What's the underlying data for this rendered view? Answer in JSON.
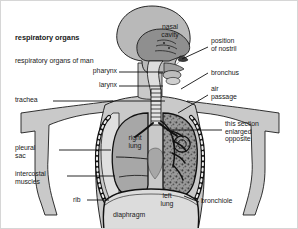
{
  "figure": {
    "title": "respiratory organs",
    "caption": "respiratory organs of man",
    "type": "anatomical-diagram"
  },
  "palette": {
    "background": "#ffffff",
    "border": "#d6d6d6",
    "text": "#1a1a1a",
    "leader_line": "#111111",
    "body_fill": "#c9c9c9",
    "head_fill": "#b9b9b9",
    "nasal_fill": "#8f8f8f",
    "lung_right_fill": "#a7a7a7",
    "lung_left_fill": "#9a9a9a",
    "diaphragm_fill": "#dcdcdc",
    "outline": "#111111"
  },
  "labels": {
    "left": [
      {
        "id": "pharynx",
        "text": "pharynx",
        "x": 82,
        "y": 68,
        "align": "right",
        "leader": {
          "x1": 118,
          "y1": 71,
          "x2": 162,
          "y2": 71
        }
      },
      {
        "id": "larynx",
        "text": "larynx",
        "x": 86,
        "y": 82,
        "align": "right",
        "leader": {
          "x1": 118,
          "y1": 85,
          "x2": 162,
          "y2": 85
        }
      },
      {
        "id": "trachea",
        "text": "trachea",
        "x": 14,
        "y": 97,
        "align": "left",
        "leader": {
          "x1": 52,
          "y1": 100,
          "x2": 164,
          "y2": 100
        }
      },
      {
        "id": "pleural-sac",
        "text": "pleural\nsac",
        "x": 14,
        "y": 146,
        "align": "left",
        "leader": {
          "x1": 58,
          "y1": 149,
          "x2": 108,
          "y2": 149
        }
      },
      {
        "id": "intercostal-muscles",
        "text": "intercostal\nmuscles",
        "x": 14,
        "y": 172,
        "align": "left",
        "leader": {
          "x1": 66,
          "y1": 175,
          "x2": 112,
          "y2": 175
        }
      },
      {
        "id": "rib",
        "text": "rib",
        "x": 72,
        "y": 196,
        "align": "left",
        "leader": {
          "x1": 86,
          "y1": 199,
          "x2": 108,
          "y2": 199
        }
      }
    ],
    "right": [
      {
        "id": "position-of-nostril",
        "text": "position\nof nostril",
        "x": 210,
        "y": 37,
        "leader": {
          "x1": 207,
          "y1": 46,
          "x2": 181,
          "y2": 58
        }
      },
      {
        "id": "bronchus",
        "text": "bronchus",
        "x": 210,
        "y": 69,
        "leader": {
          "x1": 207,
          "y1": 72,
          "x2": 180,
          "y2": 88
        }
      },
      {
        "id": "air-passage",
        "text": "air\npassage",
        "x": 210,
        "y": 85,
        "leader": {
          "x1": 207,
          "y1": 94,
          "x2": 178,
          "y2": 110
        }
      },
      {
        "id": "this-section-enlarged-opposite",
        "text": "this section\nenlarged\nopposite",
        "x": 224,
        "y": 120,
        "leader": {
          "x1": 221,
          "y1": 129,
          "x2": 168,
          "y2": 129
        }
      },
      {
        "id": "bronchiole",
        "text": "bronchiole",
        "x": 200,
        "y": 198,
        "leader": {
          "x1": 198,
          "y1": 201,
          "x2": 182,
          "y2": 196
        }
      }
    ],
    "inside": [
      {
        "id": "nasal-cavity",
        "text": "nasal\ncavity",
        "x": 152,
        "y": 24,
        "align": "center"
      },
      {
        "id": "right-lung",
        "text": "right\nlung",
        "x": 124,
        "y": 135,
        "align": "center"
      },
      {
        "id": "left-lung",
        "text": "left\nlung",
        "x": 160,
        "y": 193,
        "align": "center"
      },
      {
        "id": "diaphragm",
        "text": "diaphragm",
        "x": 115,
        "y": 212,
        "align": "left"
      }
    ]
  }
}
